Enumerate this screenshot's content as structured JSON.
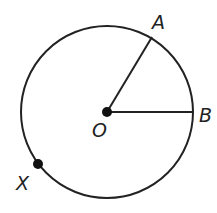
{
  "diagram": {
    "type": "circle-geometry",
    "circle": {
      "cx": 107,
      "cy": 112,
      "r": 86,
      "stroke": "#222222"
    },
    "center": {
      "label": "O",
      "x": 107,
      "y": 112
    },
    "points": [
      {
        "id": "A",
        "label": "A",
        "x": 152,
        "y": 37
      },
      {
        "id": "B",
        "label": "B",
        "x": 193,
        "y": 112
      },
      {
        "id": "X",
        "label": "X",
        "x": 38,
        "y": 164
      }
    ],
    "segments": [
      {
        "from": "O",
        "to": "A"
      },
      {
        "from": "O",
        "to": "B"
      }
    ],
    "labels": {
      "A": "A",
      "B": "B",
      "O": "O",
      "X": "X"
    }
  }
}
